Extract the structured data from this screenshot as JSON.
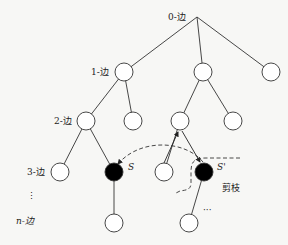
{
  "diagram": {
    "type": "search-tree-pruning",
    "level_labels": [
      {
        "id": "level-0",
        "text": "0-边",
        "x": 170,
        "y": 20
      },
      {
        "id": "level-1",
        "text": "1-边",
        "x": 90,
        "y": 75
      },
      {
        "id": "level-2",
        "text": "2-边",
        "x": 54,
        "y": 124
      },
      {
        "id": "level-3",
        "text": "3-边",
        "x": 27,
        "y": 175
      },
      {
        "id": "level-n",
        "text": "n-边",
        "x": 15,
        "y": 223
      }
    ],
    "vertical_ellipsis": "⋮",
    "node_labels": {
      "s": "S",
      "s_prime": "S'"
    },
    "pruning_label": "剪枝",
    "continuation": "···",
    "colors": {
      "line": "#333333",
      "node_fill": "#ffffff",
      "node_filled": "#000000",
      "background": "#f7f7f5"
    }
  }
}
